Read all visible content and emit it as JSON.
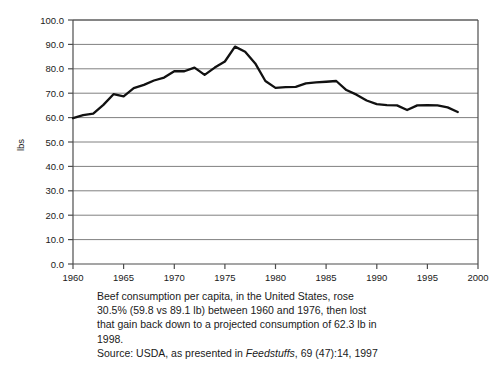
{
  "chart_data": {
    "type": "line",
    "title": "",
    "xlabel": "",
    "ylabel": "lbs",
    "xlim": [
      1960,
      2000
    ],
    "ylim": [
      0.0,
      100.0
    ],
    "grid": true,
    "legend": "none",
    "x_ticks": [
      "1960",
      "1965",
      "1970",
      "1975",
      "1980",
      "1985",
      "1990",
      "1995",
      "2000"
    ],
    "y_ticks": [
      "0.0",
      "10.0",
      "20.0",
      "30.0",
      "40.0",
      "50.0",
      "60.0",
      "70.0",
      "80.0",
      "90.0",
      "100.0"
    ],
    "series": [
      {
        "name": "Beef consumption per capita",
        "x": [
          1960,
          1961,
          1962,
          1963,
          1964,
          1965,
          1966,
          1967,
          1968,
          1969,
          1970,
          1971,
          1972,
          1973,
          1974,
          1975,
          1976,
          1977,
          1978,
          1979,
          1980,
          1981,
          1982,
          1983,
          1984,
          1985,
          1986,
          1987,
          1988,
          1989,
          1990,
          1991,
          1992,
          1993,
          1994,
          1995,
          1996,
          1997,
          1998
        ],
        "values": [
          59.8,
          61.0,
          61.6,
          65.2,
          69.6,
          68.7,
          72.1,
          73.4,
          75.2,
          76.4,
          79.0,
          79.0,
          80.5,
          77.5,
          80.5,
          83.0,
          89.1,
          87.0,
          82.2,
          75.0,
          72.2,
          72.5,
          72.6,
          74.0,
          74.4,
          74.7,
          75.0,
          71.3,
          69.4,
          67.0,
          65.5,
          65.1,
          65.0,
          63.1,
          65.0,
          65.1,
          65.0,
          64.2,
          62.3
        ]
      }
    ],
    "annotations": []
  },
  "caption": {
    "line1": "Beef consumption per capita, in the United States, rose",
    "line2": "30.5% (59.8 vs 89.1 lb) between 1960 and 1976, then lost",
    "line3": "that gain back down to a projected consumption of 62.3 lb in",
    "line4": "1998.",
    "source_prefix": "Source: USDA, as presented in ",
    "source_publication": "Feedstuffs",
    "source_suffix": ", 69 (47):14, 1997"
  },
  "colors": {
    "line": "#111111",
    "grid": "#808080",
    "axis": "#4d4d4d",
    "background": "#ffffff"
  }
}
